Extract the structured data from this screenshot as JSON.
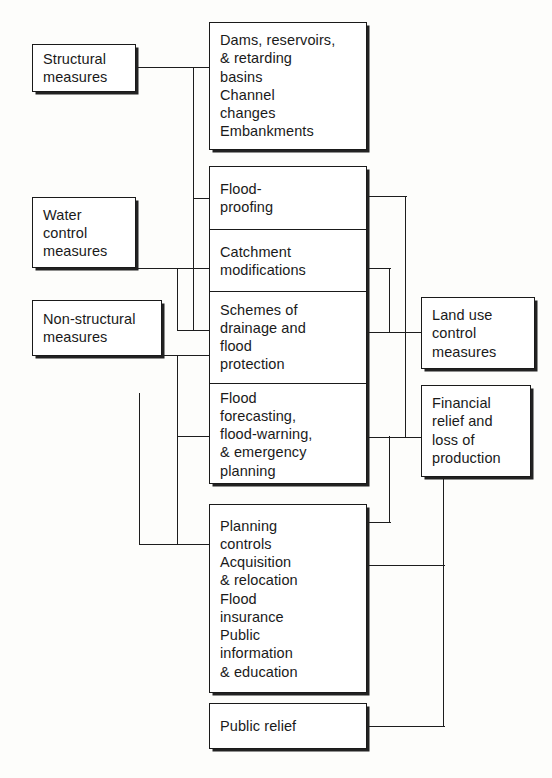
{
  "diagram": {
    "line_color": "#1d1d1d",
    "box_border_color": "#1a1a1a",
    "box_fill_color": "#ffffff",
    "background_color": "#fdfdfb"
  },
  "left_boxes": [
    {
      "id": "structural",
      "label": "Structural\nmeasures"
    },
    {
      "id": "water-control",
      "label": "Water\ncontrol\nmeasures"
    },
    {
      "id": "non-structural",
      "label": "Non-structural\nmeasures"
    }
  ],
  "center_boxes": [
    {
      "id": "dams",
      "label": "Dams, reservoirs,\n& retarding\nbasins\nChannel\nchanges\nEmbankments"
    },
    {
      "id": "planning",
      "label": "Planning\ncontrols\nAcquisition\n& relocation\nFlood\ninsurance\nPublic\ninformation\n& education"
    },
    {
      "id": "public-relief",
      "label": "Public relief"
    }
  ],
  "center_cell_group": {
    "id": "measures-group",
    "cells": [
      {
        "id": "flood-proofing",
        "label": "Flood-\nproofing"
      },
      {
        "id": "catchment",
        "label": "Catchment\nmodifications"
      },
      {
        "id": "schemes-drainage",
        "label": "Schemes of\ndrainage and\nflood\nprotection"
      },
      {
        "id": "flood-forecasting",
        "label": "Flood\nforecasting,\nflood-warning,\n& emergency\nplanning"
      }
    ]
  },
  "right_boxes": [
    {
      "id": "land-use",
      "label": "Land use\ncontrol\nmeasures"
    },
    {
      "id": "financial",
      "label": "Financial\nrelief and\nloss of\nproduction"
    }
  ]
}
